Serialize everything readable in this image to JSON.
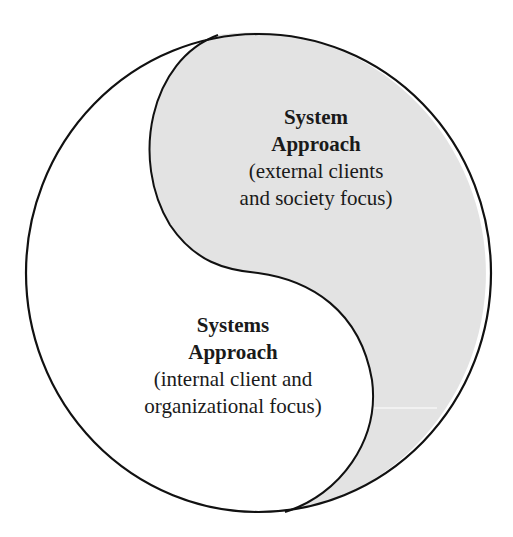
{
  "diagram": {
    "type": "yin-yang",
    "colors": {
      "outline": "#111111",
      "shaded_region": "#e3e3e3",
      "unshaded_region": "#ffffff"
    },
    "regions": [
      {
        "id": "top-right",
        "shaded": true,
        "title_line1": "System",
        "title_line2": "Approach",
        "desc_line1": "(external clients",
        "desc_line2": "and society focus)"
      },
      {
        "id": "bottom-left",
        "shaded": false,
        "title_line1": "Systems",
        "title_line2": "Approach",
        "desc_line1": "(internal client and",
        "desc_line2": "organizational focus)"
      }
    ]
  }
}
